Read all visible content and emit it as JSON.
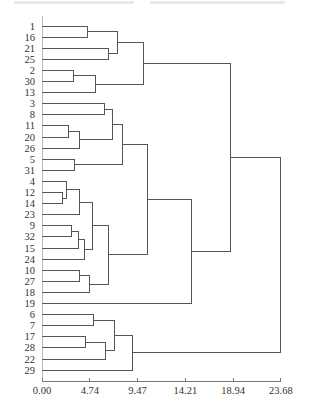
{
  "chart_data": {
    "type": "dendrogram",
    "title": "",
    "xlabel": "",
    "ylabel": "",
    "orientation": "horizontal",
    "xlim": [
      0,
      23.68
    ],
    "x_ticks": [
      "0.00",
      "4.74",
      "9.47",
      "14.21",
      "18.94",
      "23.68"
    ],
    "x_tick_values": [
      0,
      4.74,
      9.47,
      14.21,
      18.94,
      23.68
    ],
    "leaves": [
      "1",
      "16",
      "21",
      "25",
      "2",
      "30",
      "13",
      "3",
      "8",
      "11",
      "20",
      "26",
      "5",
      "31",
      "4",
      "12",
      "14",
      "23",
      "9",
      "32",
      "15",
      "24",
      "10",
      "27",
      "18",
      "19",
      "6",
      "7",
      "17",
      "28",
      "22",
      "29"
    ],
    "merges": [
      {
        "id": "A",
        "children": [
          "1",
          "16"
        ],
        "height": 4.46
      },
      {
        "id": "B",
        "children": [
          "21",
          "25"
        ],
        "height": 6.64
      },
      {
        "id": "C",
        "children": [
          "A",
          "B"
        ],
        "height": 7.53
      },
      {
        "id": "D",
        "children": [
          "2",
          "30"
        ],
        "height": 3.17
      },
      {
        "id": "E",
        "children": [
          "D",
          "13"
        ],
        "height": 5.35
      },
      {
        "id": "F",
        "children": [
          "C",
          "E"
        ],
        "height": 10.1
      },
      {
        "id": "G",
        "children": [
          "3",
          "8"
        ],
        "height": 6.24
      },
      {
        "id": "H",
        "children": [
          "11",
          "20"
        ],
        "height": 2.58
      },
      {
        "id": "I",
        "children": [
          "H",
          "26"
        ],
        "height": 3.67
      },
      {
        "id": "J",
        "children": [
          "G",
          "I"
        ],
        "height": 6.94
      },
      {
        "id": "K",
        "children": [
          "5",
          "31"
        ],
        "height": 3.27
      },
      {
        "id": "L",
        "children": [
          "J",
          "K"
        ],
        "height": 7.93
      },
      {
        "id": "M",
        "children": [
          "12",
          "14"
        ],
        "height": 2.08
      },
      {
        "id": "N",
        "children": [
          "4",
          "M"
        ],
        "height": 2.38
      },
      {
        "id": "O",
        "children": [
          "N",
          "23"
        ],
        "height": 3.67
      },
      {
        "id": "P",
        "children": [
          "9",
          "32"
        ],
        "height": 2.97
      },
      {
        "id": "Q",
        "children": [
          "P",
          "15"
        ],
        "height": 3.57
      },
      {
        "id": "R",
        "children": [
          "Q",
          "24"
        ],
        "height": 4.26
      },
      {
        "id": "S",
        "children": [
          "O",
          "R"
        ],
        "height": 5.05
      },
      {
        "id": "T",
        "children": [
          "10",
          "27"
        ],
        "height": 3.67
      },
      {
        "id": "U",
        "children": [
          "T",
          "18"
        ],
        "height": 4.66
      },
      {
        "id": "V",
        "children": [
          "S",
          "U"
        ],
        "height": 6.64
      },
      {
        "id": "W",
        "children": [
          "L",
          "V"
        ],
        "height": 10.5
      },
      {
        "id": "X",
        "children": [
          "W",
          "19"
        ],
        "height": 14.77
      },
      {
        "id": "Y",
        "children": [
          "F",
          "X"
        ],
        "height": 18.73
      },
      {
        "id": "Z1",
        "children": [
          "6",
          "7"
        ],
        "height": 5.15
      },
      {
        "id": "Z2",
        "children": [
          "17",
          "28"
        ],
        "height": 4.36
      },
      {
        "id": "Z3",
        "children": [
          "Z2",
          "22"
        ],
        "height": 6.34
      },
      {
        "id": "Z4",
        "children": [
          "Z1",
          "Z3"
        ],
        "height": 7.23
      },
      {
        "id": "Z5",
        "children": [
          "Z4",
          "29"
        ],
        "height": 8.92
      },
      {
        "id": "ROOT",
        "children": [
          "Y",
          "Z5"
        ],
        "height": 23.68
      }
    ],
    "grid": false,
    "legend": null
  },
  "layout": {
    "origin_x": 42,
    "px_per_unit": 10.09,
    "first_row_y": 26,
    "row_spacing": 11.1,
    "axis_y": 381,
    "line_color": "#555555",
    "text_color": "#333333"
  }
}
